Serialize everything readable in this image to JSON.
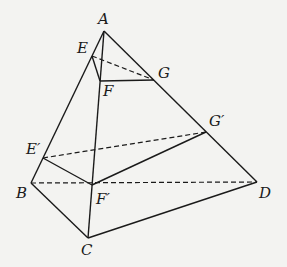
{
  "diagram": {
    "type": "pyramid-section",
    "points": {
      "A": {
        "label": "A",
        "x": 104,
        "y": 31
      },
      "E": {
        "label": "E",
        "x": 92,
        "y": 56
      },
      "F": {
        "label": "F",
        "x": 100,
        "y": 81
      },
      "G": {
        "label": "G",
        "x": 154,
        "y": 80
      },
      "E1": {
        "label": "E′",
        "x": 43,
        "y": 158
      },
      "G1": {
        "label": "G′",
        "x": 206,
        "y": 132
      },
      "F1": {
        "label": "F′",
        "x": 92,
        "y": 185
      },
      "B": {
        "label": "B",
        "x": 31,
        "y": 183
      },
      "C": {
        "label": "C",
        "x": 88,
        "y": 238
      },
      "D": {
        "label": "D",
        "x": 257,
        "y": 182
      }
    },
    "solid_edges": [
      [
        "A",
        "B"
      ],
      [
        "A",
        "C"
      ],
      [
        "A",
        "D"
      ],
      [
        "B",
        "C"
      ],
      [
        "C",
        "D"
      ],
      [
        "E",
        "F"
      ],
      [
        "F",
        "G"
      ],
      [
        "E1",
        "F1"
      ],
      [
        "F1",
        "G1"
      ]
    ],
    "dashed_edges": [
      [
        "E",
        "G"
      ],
      [
        "E1",
        "G1"
      ],
      [
        "B",
        "D"
      ]
    ],
    "line_color": "#1a1a1a"
  }
}
